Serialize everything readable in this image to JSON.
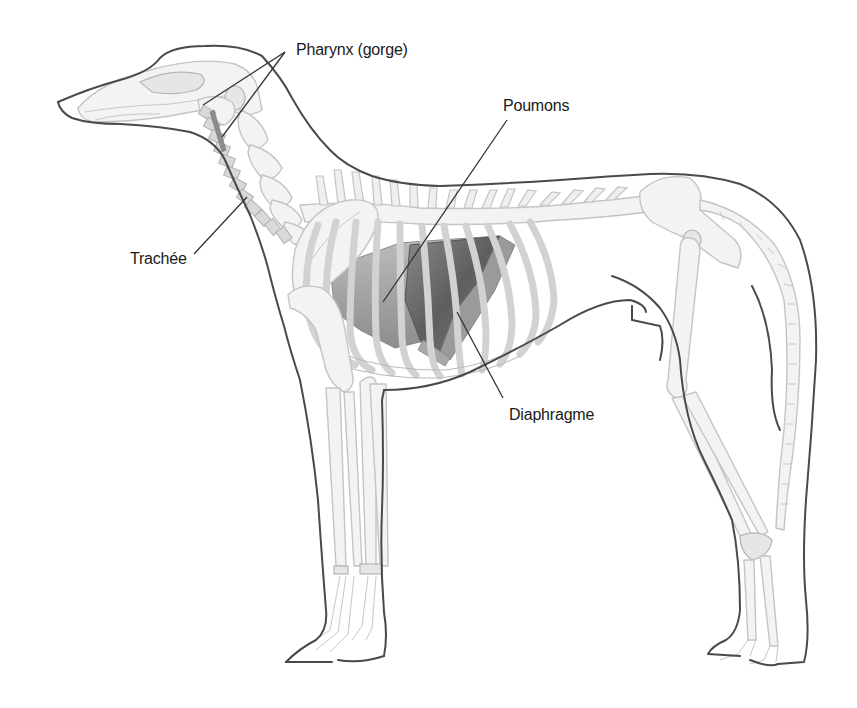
{
  "diagram": {
    "colors": {
      "background": "#ffffff",
      "outline": "#4a4a4a",
      "bone": "#f3f3f3",
      "lung": "#6e6e6e",
      "leader_line": "#333333",
      "label_text": "#1a1a1a"
    },
    "labels": {
      "pharynx": "Pharynx (gorge)",
      "poumons": "Poumons",
      "trachee": "Trachée",
      "diaphragme": "Diaphragme"
    },
    "leader_lines": {
      "pharynx": [
        [
          285,
          52
        ],
        [
          203,
          105
        ],
        [
          285,
          52
        ],
        [
          222,
          137
        ]
      ],
      "poumons": [
        [
          507,
          120
        ],
        [
          383,
          302
        ]
      ],
      "trachee": [
        [
          194,
          254
        ],
        [
          247,
          197
        ]
      ],
      "diaphragme": [
        [
          457,
          312
        ],
        [
          503,
          398
        ]
      ]
    }
  }
}
